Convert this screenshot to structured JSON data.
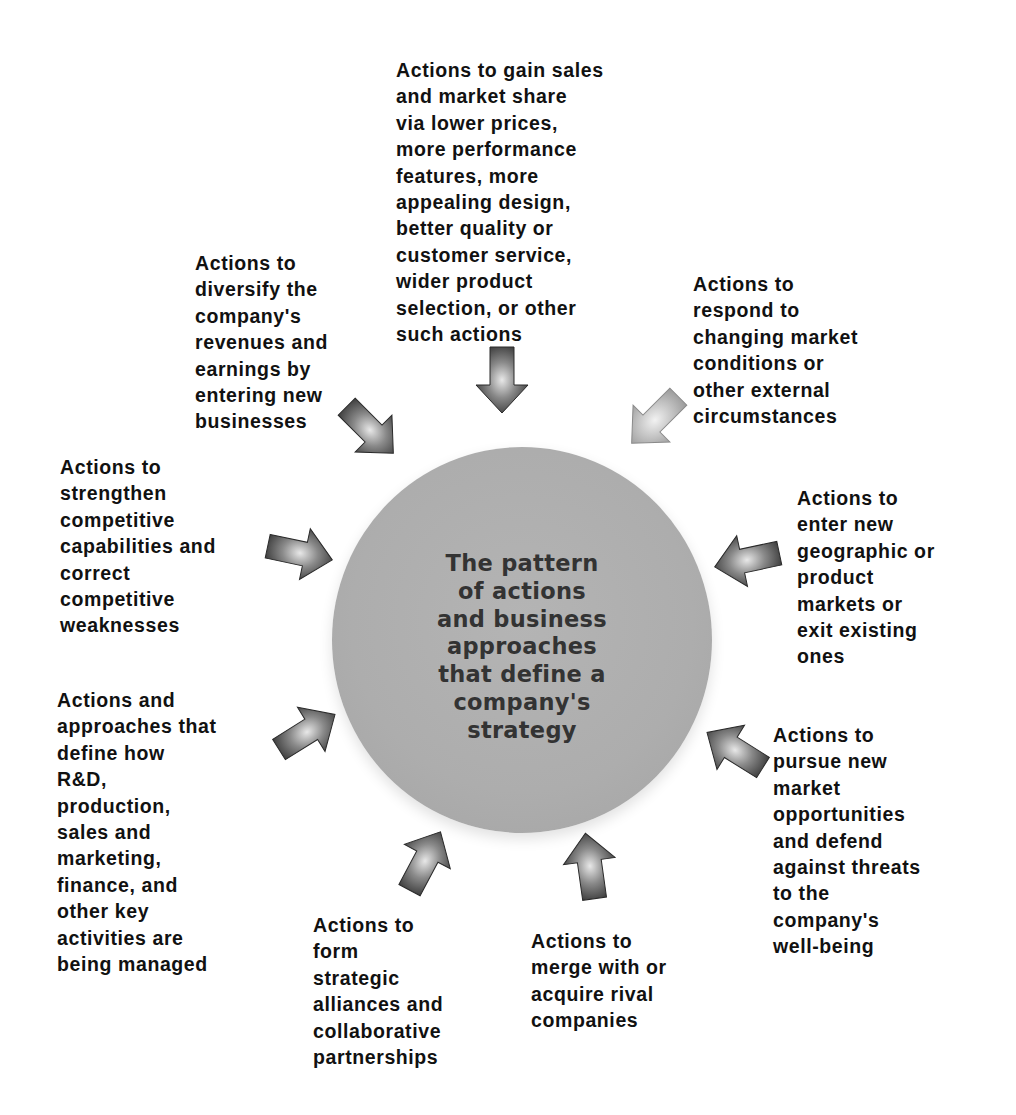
{
  "diagram": {
    "type": "hub-and-spoke",
    "center": {
      "text": "The pattern\nof actions\nand business\napproaches\nthat define a\ncompany's\nstrategy"
    },
    "colors": {
      "hub_fill": "#adadad",
      "arrow_dark": "#3d3d3d",
      "arrow_light": "#9a9a9a",
      "text": "#111111"
    },
    "spokes": [
      {
        "id": "sales",
        "text": "Actions to gain sales\nand market share\nvia lower prices,\nmore performance\nfeatures, more\nappealing design,\nbetter quality or\ncustomer service,\nwider product\nselection, or other\nsuch actions"
      },
      {
        "id": "diversify",
        "text": "Actions to\ndiversify the\ncompany's\nrevenues and\nearnings by\nentering new\nbusinesses"
      },
      {
        "id": "respond",
        "text": "Actions to\nrespond to\nchanging market\nconditions or\nother external\ncircumstances"
      },
      {
        "id": "strengthen",
        "text": "Actions to\nstrengthen\ncompetitive\ncapabilities and\ncorrect\ncompetitive\nweaknesses"
      },
      {
        "id": "enter-markets",
        "text": "Actions to\nenter new\ngeographic or\nproduct\nmarkets or\nexit existing\nones"
      },
      {
        "id": "manage-activities",
        "text": "Actions and\napproaches that\ndefine how\nR&D,\nproduction,\nsales and\nmarketing,\nfinance, and\nother key\nactivities are\nbeing managed"
      },
      {
        "id": "pursue-opportunities",
        "text": "Actions to\npursue new\nmarket\nopportunities\nand defend\nagainst threats\nto the\ncompany's\nwell-being"
      },
      {
        "id": "alliances",
        "text": "Actions to\nform\nstrategic\nalliances and\ncollaborative\npartnerships"
      },
      {
        "id": "merge",
        "text": "Actions to\nmerge with or\nacquire rival\ncompanies"
      }
    ]
  }
}
